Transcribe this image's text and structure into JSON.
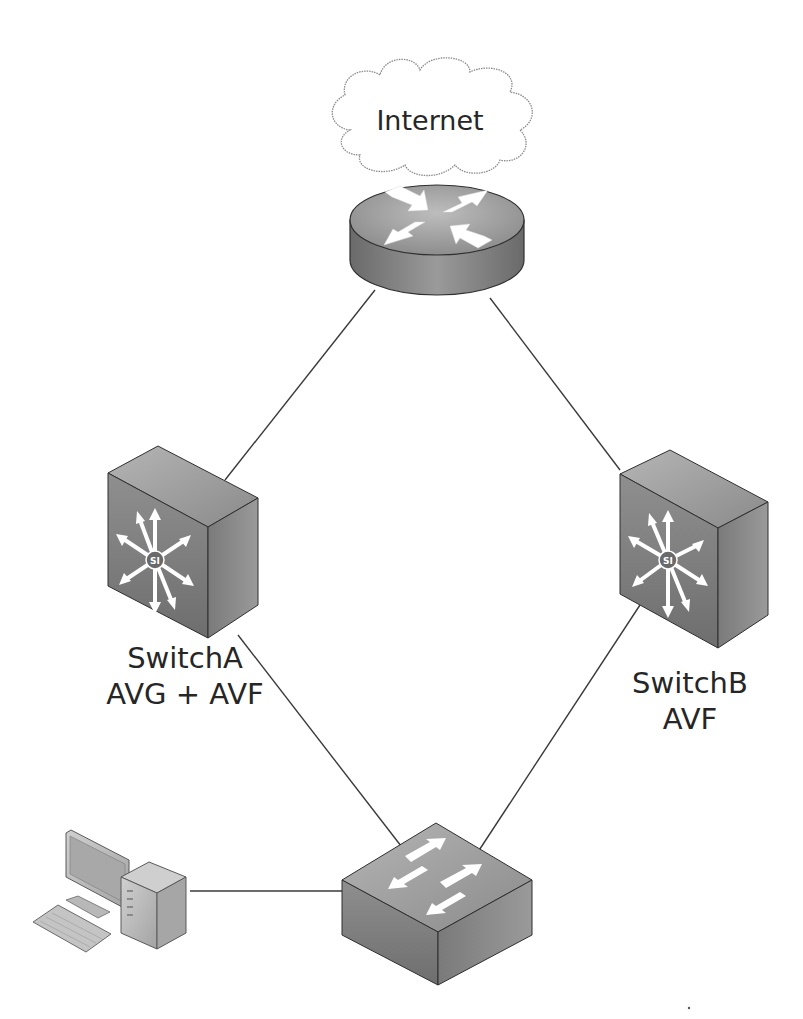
{
  "diagram": {
    "type": "network-topology",
    "nodes": {
      "internet": {
        "label": "Internet",
        "icon": "cloud-icon"
      },
      "router": {
        "label": "",
        "icon": "router-icon"
      },
      "switch_a": {
        "name": "SwitchA",
        "role": "AVG + AVF",
        "icon": "layer3-switch-icon"
      },
      "switch_b": {
        "name": "SwitchB",
        "role": "AVF",
        "icon": "layer3-switch-icon"
      },
      "access_switch": {
        "label": "",
        "icon": "layer2-switch-icon"
      },
      "pc": {
        "label": "",
        "icon": "workstation-icon"
      }
    },
    "links": [
      {
        "from": "internet",
        "to": "router"
      },
      {
        "from": "router",
        "to": "switch_a"
      },
      {
        "from": "router",
        "to": "switch_b"
      },
      {
        "from": "switch_a",
        "to": "access_switch"
      },
      {
        "from": "switch_b",
        "to": "access_switch"
      },
      {
        "from": "pc",
        "to": "access_switch"
      }
    ],
    "colors": {
      "line": "#3a3a3a",
      "device_dark": "#5a5a5a",
      "device_mid": "#8c8c8c",
      "device_light": "#b8b8b8",
      "arrow": "#ffffff",
      "cloud_stroke": "#8a8a8a",
      "text": "#262626"
    }
  }
}
